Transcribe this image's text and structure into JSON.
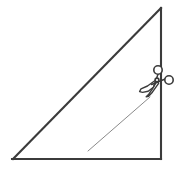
{
  "diagram": {
    "title": "Right triangle with scissors cut line",
    "canvas": {
      "width": 184,
      "height": 170
    },
    "background_color": "#ffffff",
    "outline_color": "#3b3b3b",
    "cut_line_color": "#8a8a8a",
    "shape": {
      "name": "right-triangle",
      "vertices": [
        {
          "label": "apex-top-right",
          "x": 161,
          "y": 8
        },
        {
          "label": "bottom-right",
          "x": 161,
          "y": 159
        },
        {
          "label": "bottom-left",
          "x": 13,
          "y": 159
        }
      ],
      "edges": [
        {
          "name": "hypotenuse",
          "from": "apex-top-right",
          "to": "bottom-left"
        },
        {
          "name": "vertical-right-leg",
          "from": "apex-top-right",
          "to": "bottom-right"
        },
        {
          "name": "horizontal-bottom-leg",
          "from": "bottom-left",
          "to": "bottom-right"
        }
      ]
    },
    "cut_line": {
      "name": "cut-path",
      "from": {
        "x": 88,
        "y": 151
      },
      "to": {
        "x": 150,
        "y": 97
      }
    },
    "scissors": {
      "name": "scissors-icon",
      "position": {
        "x": 140,
        "y": 62,
        "width": 38,
        "height": 40
      },
      "pivot": {
        "x": 157,
        "y": 80
      },
      "rings": [
        {
          "name": "upper-handle-ring",
          "cx": 158,
          "cy": 70,
          "r": 4.2
        },
        {
          "name": "right-handle-ring",
          "cx": 169,
          "cy": 80,
          "r": 4.2
        }
      ],
      "blade_tip": {
        "x": 145,
        "y": 96
      }
    }
  }
}
